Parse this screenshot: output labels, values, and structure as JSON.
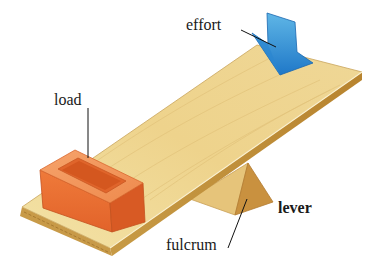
{
  "diagram": {
    "subject": "lever",
    "labels": {
      "effort": "effort",
      "load": "load",
      "lever": "lever",
      "fulcrum": "fulcrum"
    },
    "parts": [
      {
        "name": "board",
        "description": "wooden plank resting on fulcrum",
        "color": "#eed58f"
      },
      {
        "name": "load",
        "description": "orange brick on left end of board",
        "color": "#e8672a"
      },
      {
        "name": "fulcrum",
        "description": "triangular wooden wedge under board",
        "color": "#d9a94f"
      },
      {
        "name": "effort",
        "description": "blue downward arrow on right end of board",
        "color": "#2f8fd6"
      }
    ]
  }
}
